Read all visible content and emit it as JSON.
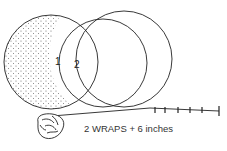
{
  "diagram": {
    "caption": "2 WRAPS + 6 inches",
    "wrap_labels": [
      "1",
      "2"
    ],
    "colors": {
      "line": "#222222",
      "stipple": "#555555",
      "background": "#ffffff"
    },
    "elements": {
      "ball": "rope ball / bundle",
      "circles": 3,
      "measure_ticks": 6
    }
  }
}
